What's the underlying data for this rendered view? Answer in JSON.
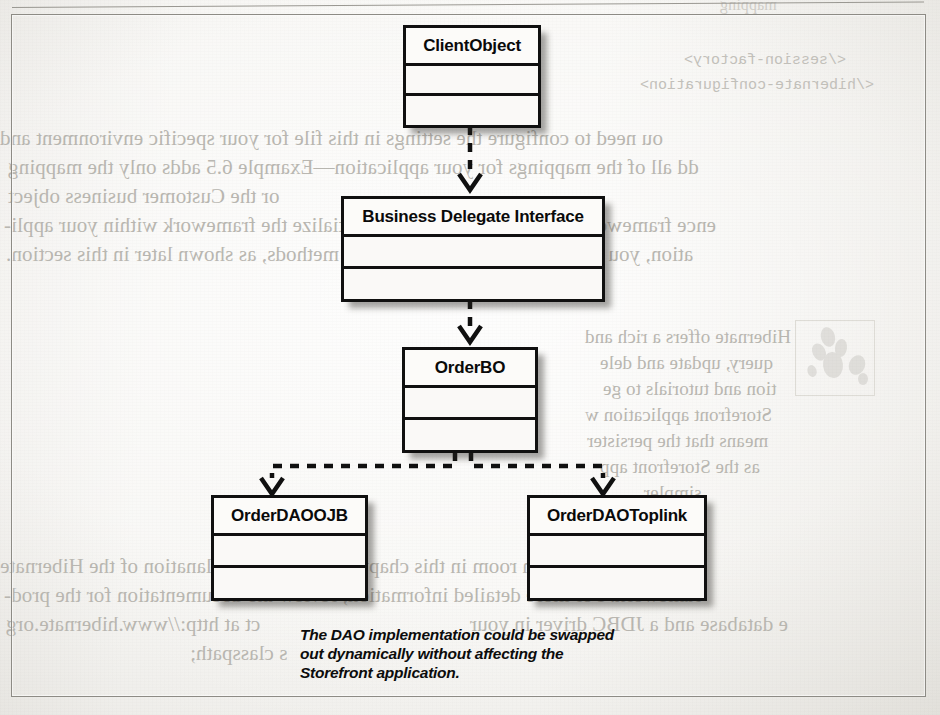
{
  "page": {
    "kind": "scanned-book-page",
    "figure_type": "uml-class-diagram"
  },
  "diagram": {
    "boxes": [
      {
        "id": "client-object",
        "name": "ClientObject"
      },
      {
        "id": "business-delegate",
        "name": "Business Delegate Interface"
      },
      {
        "id": "order-bo",
        "name": "OrderBO"
      },
      {
        "id": "order-dao-ojb",
        "name": "OrderDAOOJB"
      },
      {
        "id": "order-dao-toplink",
        "name": "OrderDAOToplink"
      }
    ],
    "connectors": [
      {
        "from": "ClientObject",
        "to": "Business Delegate Interface",
        "style": "dashed",
        "arrow": "open"
      },
      {
        "from": "Business Delegate Interface",
        "to": "OrderBO",
        "style": "dashed",
        "arrow": "open"
      },
      {
        "from": "OrderBO",
        "to": "OrderDAOOJB",
        "style": "dashed",
        "arrow": "open"
      },
      {
        "from": "OrderBO",
        "to": "OrderDAOToplink",
        "style": "dashed",
        "arrow": "open"
      }
    ],
    "caption": "The DAO implementation could be swapped\nout dynamically without affecting the\nStorefront application."
  },
  "bleed_through": {
    "note": "mirrored show-through text from the reverse side of the scanned page",
    "code_lines": [
      "</session-factory>",
      "</hibernate-configuration>"
    ],
    "paragraph_1": [
      "ou need to configure the settings in this file for your specific environment and",
      "dd all of the mappings for your application—Example 6.5 adds only the mapping",
      "or the Customer business object",
      "ence framework for your application. To initialize the framework within your appli-",
      "ation, you simply call a few initialization methods, as shown later in this section."
    ],
    "paragraph_2": [
      "Hibernate offers a rich and",
      "query, update and dele",
      "tion and tutorials to ge",
      "Storefront application w",
      "means that the persister",
      "as the Storefront app",
      "simpler."
    ],
    "paragraph_3": [
      "here's not enough room in this chapter for a better explanation of the Hibernate",
      "ramework. For more detailed information, review the documentation for the prod-",
      "ct at http://www.hibernate.org",
      "e database and a JDBC driver in your",
      "s classpath;"
    ],
    "fragment_top": "mapping",
    "icon": "oreilly-animal-icon"
  }
}
